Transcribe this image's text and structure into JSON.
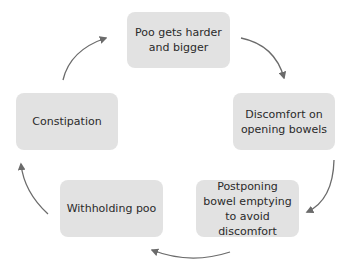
{
  "diagram": {
    "type": "cycle",
    "colors": {
      "box_fill": "#e2e2e2",
      "arrow": "#6b6b6b",
      "text": "#2a2a2a"
    },
    "nodes": [
      {
        "id": "n1",
        "label": "Poo gets harder and bigger"
      },
      {
        "id": "n2",
        "label": "Discomfort on opening bowels"
      },
      {
        "id": "n3",
        "label": "Postponing bowel emptying to avoid discomfort"
      },
      {
        "id": "n4",
        "label": "Withholding poo"
      },
      {
        "id": "n5",
        "label": "Constipation"
      }
    ],
    "edges": [
      {
        "from": "n1",
        "to": "n2"
      },
      {
        "from": "n2",
        "to": "n3"
      },
      {
        "from": "n3",
        "to": "n4"
      },
      {
        "from": "n4",
        "to": "n5"
      },
      {
        "from": "n5",
        "to": "n1"
      }
    ]
  }
}
